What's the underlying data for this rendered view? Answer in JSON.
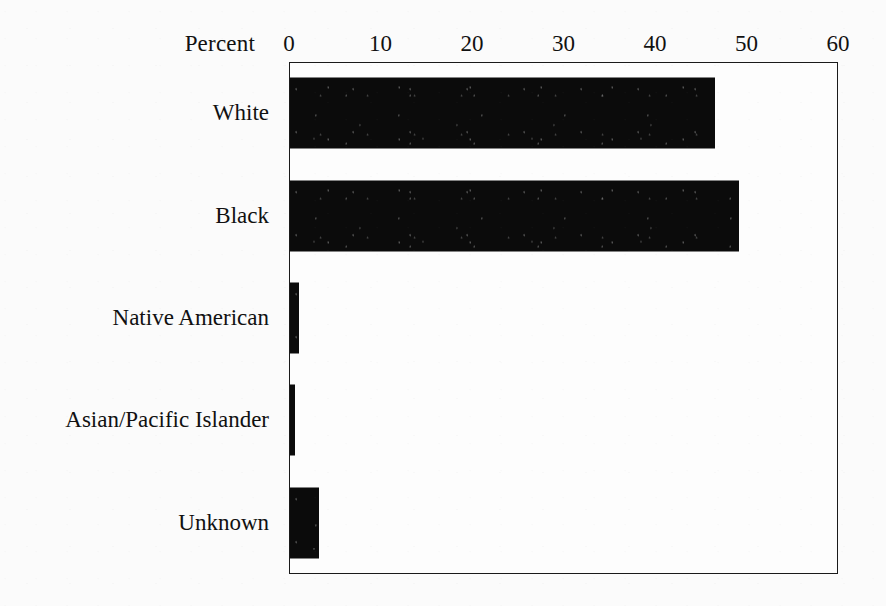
{
  "chart_data": {
    "type": "bar",
    "orientation": "horizontal",
    "title": "",
    "xlabel": "Percent",
    "ylabel": "",
    "categories": [
      "White",
      "Black",
      "Native American",
      "Asian/Pacific Islander",
      "Unknown"
    ],
    "values": [
      46.4,
      49.1,
      1.0,
      0.5,
      3.2
    ],
    "xlim": [
      0,
      60
    ],
    "xticks": [
      0,
      10,
      20,
      30,
      40,
      50,
      60
    ],
    "xtick_labels": [
      "0",
      "10",
      "20",
      "30",
      "40",
      "50",
      "60"
    ],
    "grid": false,
    "legend": null,
    "axis_position": "top",
    "bar_color": "#0b0b0b",
    "frame_color": "#1a1a1a",
    "background_color": "#fbfbfb"
  },
  "axis": {
    "title": "Percent",
    "ticks": [
      {
        "label": "0",
        "value": 0
      },
      {
        "label": "10",
        "value": 10
      },
      {
        "label": "20",
        "value": 20
      },
      {
        "label": "30",
        "value": 30
      },
      {
        "label": "40",
        "value": 40
      },
      {
        "label": "50",
        "value": 50
      },
      {
        "label": "60",
        "value": 60
      }
    ]
  },
  "bars": [
    {
      "label": "White",
      "value": 46.4
    },
    {
      "label": "Black",
      "value": 49.1
    },
    {
      "label": "Native American",
      "value": 1.0
    },
    {
      "label": "Asian/Pacific Islander",
      "value": 0.5
    },
    {
      "label": "Unknown",
      "value": 3.2
    }
  ]
}
